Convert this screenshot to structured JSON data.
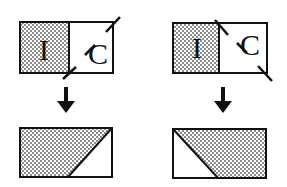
{
  "colors": {
    "ink": "#111111",
    "stipple": "#777777",
    "background": "#ffffff"
  },
  "panels": [
    {
      "id": "left",
      "top": {
        "left_label": "I",
        "right_label": "C",
        "cut": "diagonal from bottom-center to top-right"
      },
      "bottom": {
        "shape": "rectangle with shaded trapezoid, white triangle at bottom-right"
      }
    },
    {
      "id": "right",
      "top": {
        "left_label": "I",
        "right_label": "C",
        "cut": "diagonal from top-center to bottom-right"
      },
      "bottom": {
        "shape": "rectangle with shaded trapezoid, white triangle at bottom-left"
      }
    }
  ]
}
